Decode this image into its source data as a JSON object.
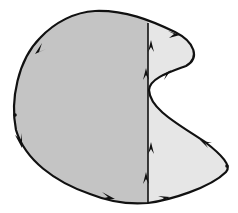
{
  "diagram": {
    "colors": {
      "left_region_fill": "#c4c4c4",
      "right_region_fill": "#e6e6e6",
      "stroke": "#111111",
      "background": "#ffffff"
    },
    "regions": [
      {
        "id": "left-region",
        "shade": "dark-gray"
      },
      {
        "id": "right-region",
        "shade": "light-gray"
      }
    ],
    "divider": {
      "x": 148,
      "y_top": 24,
      "y_bottom": 203
    },
    "arrows": [
      {
        "id": "arrow-top-left",
        "direction": "down-left"
      },
      {
        "id": "arrow-left-lower",
        "direction": "down-right"
      },
      {
        "id": "arrow-bottom-left",
        "direction": "right"
      },
      {
        "id": "arrow-bottom-right",
        "direction": "right"
      },
      {
        "id": "arrow-right-lower",
        "direction": "up-left"
      },
      {
        "id": "arrow-right-notch",
        "direction": "up-right"
      },
      {
        "id": "arrow-right-top",
        "direction": "right"
      },
      {
        "id": "arrow-divider-upper-1",
        "direction": "up"
      },
      {
        "id": "arrow-divider-upper-2",
        "direction": "up"
      },
      {
        "id": "arrow-divider-lower-1",
        "direction": "up"
      },
      {
        "id": "arrow-divider-lower-2",
        "direction": "up"
      }
    ]
  }
}
